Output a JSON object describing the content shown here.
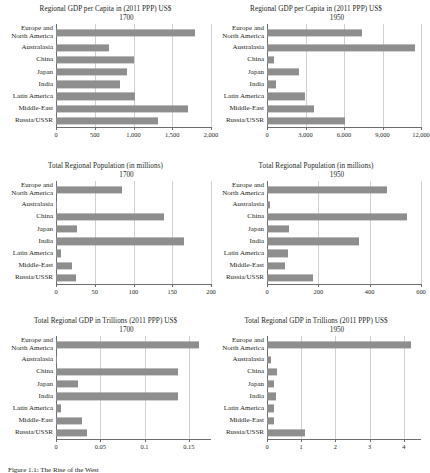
{
  "figure": {
    "caption": "Figure 1.1: The Rise of the West",
    "categories": [
      "Europe and\nNorth America",
      "Australasia",
      "China",
      "Japan",
      "India",
      "Latin America",
      "Middle-East",
      "Russia/USSR"
    ],
    "bar_color": "#8e8e8e",
    "axis_color": "#6d6d6d",
    "grid_color": "#d0d0d0"
  },
  "chart_data": [
    {
      "id": "gdp-per-capita-1700",
      "type": "bar",
      "orientation": "horizontal",
      "title": "Regional GDP per Capita in (2011 PPP) US$",
      "subtitle": "1700",
      "xlabel": "",
      "ylabel": "",
      "categories": [
        "Europe and\nNorth America",
        "Australasia",
        "China",
        "Japan",
        "India",
        "Latin America",
        "Middle-East",
        "Russia/USSR"
      ],
      "values": [
        1790,
        690,
        1010,
        910,
        830,
        1020,
        1700,
        1320
      ],
      "xlim": [
        0,
        2000
      ],
      "ticks": [
        0,
        500,
        1000,
        1500,
        2000
      ],
      "tick_labels": [
        "0",
        "500",
        "1,000",
        "1,500",
        "2,000"
      ],
      "grid": true
    },
    {
      "id": "gdp-per-capita-1950",
      "type": "bar",
      "orientation": "horizontal",
      "title": "Regional GDP per Capita in (2011 PPP) US$",
      "subtitle": "1950",
      "xlabel": "",
      "ylabel": "",
      "categories": [
        "Europe and\nNorth America",
        "Australasia",
        "China",
        "Japan",
        "India",
        "Latin America",
        "Middle-East",
        "Russia/USSR"
      ],
      "values": [
        7400,
        11500,
        550,
        2500,
        700,
        2950,
        3700,
        6100
      ],
      "xlim": [
        0,
        12000
      ],
      "ticks": [
        0,
        3000,
        6000,
        9000,
        12000
      ],
      "tick_labels": [
        "0",
        "3,000",
        "6,000",
        "9,000",
        "12,000"
      ],
      "grid": true
    },
    {
      "id": "population-1700",
      "type": "bar",
      "orientation": "horizontal",
      "title": "Total Regional Population (in millions)",
      "subtitle": "1700",
      "xlabel": "",
      "ylabel": "",
      "categories": [
        "Europe and\nNorth America",
        "Australasia",
        "China",
        "Japan",
        "India",
        "Latin America",
        "Middle-East",
        "Russia/USSR"
      ],
      "values": [
        85,
        0.4,
        139,
        27,
        165,
        6,
        21,
        26
      ],
      "xlim": [
        0,
        200
      ],
      "ticks": [
        0,
        50,
        100,
        150,
        200
      ],
      "tick_labels": [
        "0",
        "50",
        "100",
        "150",
        "200"
      ],
      "grid": true
    },
    {
      "id": "population-1950",
      "type": "bar",
      "orientation": "horizontal",
      "title": "Total Regional Population (in millions)",
      "subtitle": "1950",
      "xlabel": "",
      "ylabel": "",
      "categories": [
        "Europe and\nNorth America",
        "Australasia",
        "China",
        "Japan",
        "India",
        "Latin America",
        "Middle-East",
        "Russia/USSR"
      ],
      "values": [
        468,
        10,
        546,
        84,
        358,
        80,
        72,
        180
      ],
      "xlim": [
        0,
        600
      ],
      "ticks": [
        0,
        200,
        400,
        600
      ],
      "tick_labels": [
        "0",
        "200",
        "400",
        "600"
      ],
      "grid": true
    },
    {
      "id": "total-gdp-1700",
      "type": "bar",
      "orientation": "horizontal",
      "title": "Total Regional GDP in Trillions (2011 PPP) US$",
      "subtitle": "1700",
      "xlabel": "",
      "ylabel": "",
      "categories": [
        "Europe and\nNorth America",
        "Australasia",
        "China",
        "Japan",
        "India",
        "Latin America",
        "Middle-East",
        "Russia/USSR"
      ],
      "values": [
        0.161,
        0.0005,
        0.138,
        0.0245,
        0.138,
        0.006,
        0.029,
        0.035
      ],
      "xlim": [
        0,
        0.175
      ],
      "ticks": [
        0,
        0.05,
        0.1,
        0.15
      ],
      "tick_labels": [
        "0",
        "0.05",
        "0.1",
        "0.15"
      ],
      "grid": true
    },
    {
      "id": "total-gdp-1950",
      "type": "bar",
      "orientation": "horizontal",
      "title": "Total Regional GDP in Trillions (2011 PPP) US$",
      "subtitle": "1950",
      "xlabel": "",
      "ylabel": "",
      "categories": [
        "Europe and\nNorth America",
        "Australasia",
        "China",
        "Japan",
        "India",
        "Latin America",
        "Middle-East",
        "Russia/USSR"
      ],
      "values": [
        4.2,
        0.11,
        0.3,
        0.21,
        0.26,
        0.2,
        0.21,
        1.1
      ],
      "xlim": [
        0,
        4.5
      ],
      "ticks": [
        0,
        1,
        2,
        3,
        4
      ],
      "tick_labels": [
        "0",
        "1",
        "2",
        "3",
        "4"
      ],
      "grid": true
    }
  ]
}
